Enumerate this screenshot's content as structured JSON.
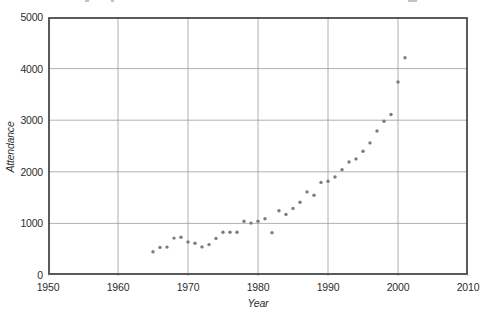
{
  "chart_data": {
    "type": "scatter",
    "title": "",
    "xlabel": "Year",
    "ylabel": "Attendance",
    "xlim": [
      1950,
      2010
    ],
    "ylim": [
      0,
      5000
    ],
    "x_ticks": [
      1950,
      1960,
      1970,
      1980,
      1990,
      2000,
      2010
    ],
    "y_ticks": [
      0,
      1000,
      2000,
      3000,
      4000,
      5000
    ],
    "grid": true,
    "legend": false,
    "points": [
      [
        1965,
        450
      ],
      [
        1966,
        535
      ],
      [
        1967,
        540
      ],
      [
        1968,
        715
      ],
      [
        1969,
        730
      ],
      [
        1970,
        640
      ],
      [
        1971,
        615
      ],
      [
        1972,
        545
      ],
      [
        1973,
        590
      ],
      [
        1974,
        710
      ],
      [
        1975,
        830
      ],
      [
        1976,
        830
      ],
      [
        1977,
        830
      ],
      [
        1978,
        1040
      ],
      [
        1979,
        1005
      ],
      [
        1980,
        1040
      ],
      [
        1981,
        1090
      ],
      [
        1982,
        820
      ],
      [
        1983,
        1245
      ],
      [
        1984,
        1175
      ],
      [
        1985,
        1290
      ],
      [
        1986,
        1410
      ],
      [
        1987,
        1610
      ],
      [
        1988,
        1545
      ],
      [
        1989,
        1795
      ],
      [
        1990,
        1815
      ],
      [
        1991,
        1900
      ],
      [
        1992,
        2040
      ],
      [
        1993,
        2190
      ],
      [
        1994,
        2250
      ],
      [
        1995,
        2400
      ],
      [
        1996,
        2560
      ],
      [
        1997,
        2790
      ],
      [
        1998,
        2980
      ],
      [
        1999,
        3110
      ],
      [
        2000,
        3740
      ],
      [
        2001,
        4210
      ]
    ]
  },
  "colors": {
    "point": "#7c7c7c",
    "frame": "#4a4a4a",
    "grid": "#9d9d9d",
    "text": "#2d2d2d",
    "background": "#ffffff"
  },
  "layout_hints": {
    "plot_left": 48,
    "plot_top": 17,
    "plot_width": 420,
    "plot_height": 258
  }
}
